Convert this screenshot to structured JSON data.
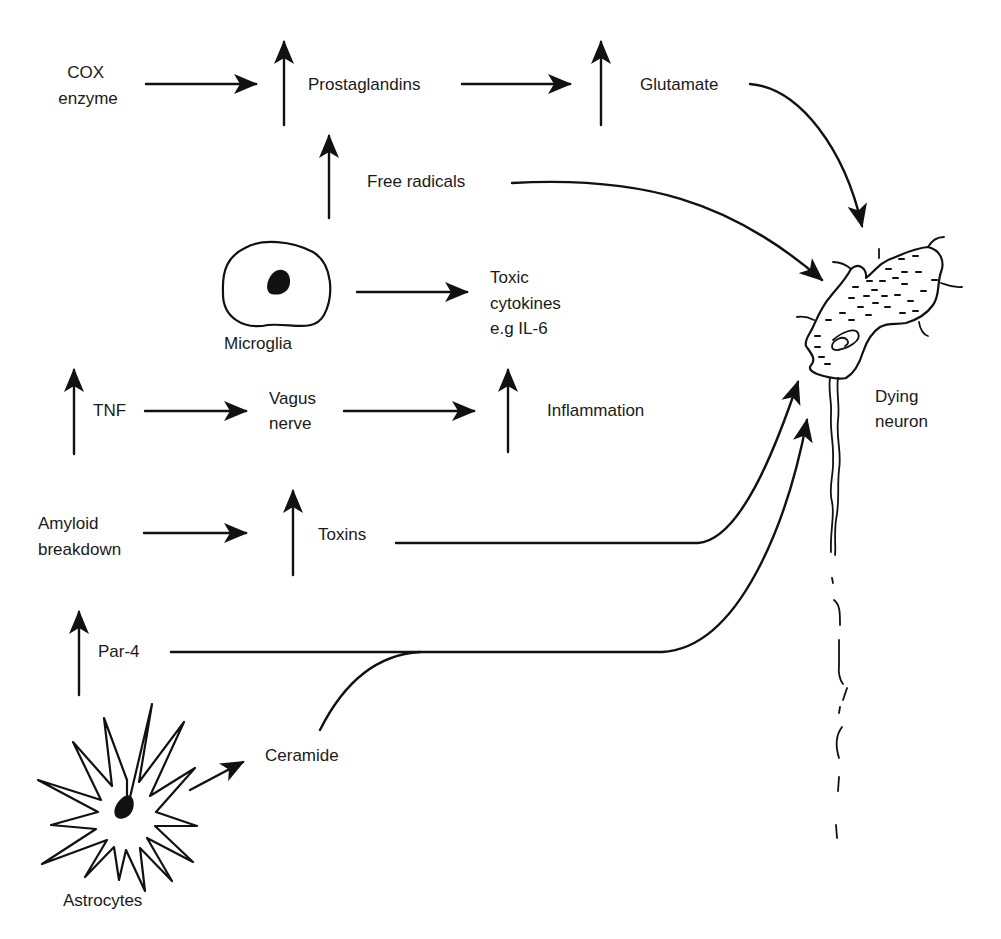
{
  "diagram": {
    "title": "",
    "nodes": {
      "cox_enzyme": {
        "line1": "COX",
        "line2": "enzyme"
      },
      "prostaglandins": {
        "label": "Prostaglandins",
        "indicator": "increase"
      },
      "glutamate": {
        "label": "Glutamate",
        "indicator": "increase"
      },
      "free_radicals": {
        "label": "Free radicals",
        "indicator": "increase"
      },
      "microglia": {
        "label": "Microglia"
      },
      "toxic_cytokines": {
        "line1": "Toxic",
        "line2": "cytokines",
        "line3": "e.g IL-6"
      },
      "tnf": {
        "label": "TNF",
        "indicator": "increase"
      },
      "vagus_nerve": {
        "line1": "Vagus",
        "line2": "nerve"
      },
      "inflammation": {
        "label": "Inflammation",
        "indicator": "increase"
      },
      "amyloid_breakdown": {
        "line1": "Amyloid",
        "line2": "breakdown"
      },
      "toxins": {
        "label": "Toxins",
        "indicator": "increase"
      },
      "par4": {
        "label": "Par-4",
        "indicator": "increase"
      },
      "ceramide": {
        "label": "Ceramide"
      },
      "astrocytes": {
        "label": "Astrocytes"
      },
      "dying_neuron": {
        "line1": "Dying",
        "line2": "neuron"
      }
    },
    "edges": [
      {
        "from": "COX enzyme",
        "to": "Prostaglandins"
      },
      {
        "from": "Prostaglandins",
        "to": "Glutamate"
      },
      {
        "from": "Glutamate",
        "to": "Dying neuron"
      },
      {
        "from": "Free radicals",
        "to": "Prostaglandins"
      },
      {
        "from": "Microglia",
        "to": "Free radicals"
      },
      {
        "from": "Free radicals",
        "to": "Dying neuron"
      },
      {
        "from": "Microglia",
        "to": "Toxic cytokines e.g IL-6"
      },
      {
        "from": "TNF",
        "to": "Vagus nerve"
      },
      {
        "from": "Vagus nerve",
        "to": "Inflammation"
      },
      {
        "from": "Inflammation",
        "to": "Toxic cytokines e.g IL-6"
      },
      {
        "from": "Amyloid breakdown",
        "to": "Toxins"
      },
      {
        "from": "Toxins",
        "to": "Vagus nerve"
      },
      {
        "from": "Toxins",
        "to": "Dying neuron"
      },
      {
        "from": "Astrocytes",
        "to": "Par-4"
      },
      {
        "from": "Astrocytes",
        "to": "Ceramide"
      },
      {
        "from": "Par-4",
        "to": "Dying neuron"
      },
      {
        "from": "Ceramide",
        "to": "Dying neuron"
      }
    ],
    "colors": {
      "stroke": "#111111",
      "background": "#ffffff"
    }
  }
}
